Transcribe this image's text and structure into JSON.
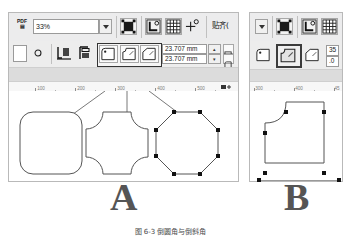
{
  "figure": {
    "caption": "图 6-3  倒圆角与倒斜角",
    "panel_a_label": "A",
    "panel_b_label": "B"
  },
  "panel_a": {
    "toolbar_top": {
      "app_icon": "pdf-icon",
      "zoom_value": "33%",
      "zoom_placeholder": "33%",
      "buttons": [
        {
          "name": "zoom-dropdown-toggle",
          "icon": "chevron-down-icon",
          "label": ""
        },
        {
          "name": "selection-tool-button",
          "icon": "selection-square-icon",
          "label": ""
        },
        {
          "name": "snap-bounding-box-button",
          "icon": "bbox-corner-icon",
          "label": ""
        },
        {
          "name": "snap-grid-button",
          "icon": "grid-icon",
          "label": ""
        },
        {
          "name": "snap-node-button",
          "icon": "node-snap-icon",
          "label": ""
        }
      ],
      "snap_label": "贴齐("
    },
    "toolbar_second": {
      "buttons": [
        {
          "name": "corner-radius-preview-button",
          "icon": "blank-box-icon",
          "label": ""
        },
        {
          "name": "ellipse-tool-button",
          "icon": "circle-icon",
          "label": ""
        },
        {
          "name": "mirror-horizontal-button",
          "icon": "mirror-h-icon",
          "label": ""
        },
        {
          "name": "mirror-vertical-button",
          "icon": "mirror-v-icon",
          "label": ""
        }
      ],
      "corner_types": [
        {
          "name": "corner-type-round-button",
          "icon": "round-corner-icon",
          "label": "",
          "selected": false
        },
        {
          "name": "corner-type-inverted-button",
          "icon": "inverted-corner-icon",
          "label": "",
          "selected": false
        },
        {
          "name": "corner-type-chamfer-button",
          "icon": "chamfer-corner-icon",
          "label": "",
          "selected": false
        }
      ],
      "radius_x": "23.707 mm",
      "radius_y": "23.707 mm",
      "stepper_up": "▴",
      "stepper_down": "▾",
      "lock_button_name": "lock-ratio-button",
      "corner_all_button_name": "apply-all-corners-button"
    },
    "ruler": {
      "labels": [
        "100",
        "200",
        "300",
        "400",
        "500"
      ],
      "unit_icon": "ruler-unit-icon"
    },
    "shapes": [
      {
        "name": "rounded-rectangle-shape",
        "type": "round"
      },
      {
        "name": "scalloped-square-shape",
        "type": "inverted"
      },
      {
        "name": "chamfered-octagon-shape",
        "type": "chamfer",
        "selected": true,
        "handle_count": 8
      }
    ]
  },
  "panel_b": {
    "toolbar_top": {
      "buttons": [
        {
          "name": "zoom-dropdown-toggle",
          "icon": "chevron-down-icon",
          "label": ""
        },
        {
          "name": "selection-tool-button",
          "icon": "selection-square-icon",
          "label": ""
        },
        {
          "name": "snap-bounding-box-button",
          "icon": "bbox-corner-icon",
          "label": ""
        },
        {
          "name": "snap-grid-button",
          "icon": "grid-icon",
          "label": ""
        }
      ]
    },
    "toolbar_second": {
      "corner_types": [
        {
          "name": "corner-type-round-button",
          "icon": "round-corner-icon",
          "label": "",
          "selected": false
        },
        {
          "name": "corner-type-inverted-button",
          "icon": "inverted-corner-icon",
          "label": "",
          "selected": true
        },
        {
          "name": "corner-type-chamfer-button",
          "icon": "chamfer-corner-icon",
          "label": "",
          "selected": false
        }
      ],
      "value_top": "35",
      "value_bottom": ".0"
    },
    "ruler": {
      "labels": [
        "300",
        "400",
        "45"
      ]
    },
    "shapes": [
      {
        "name": "single-inverted-corner-shape",
        "type": "inverted-one",
        "selected": true,
        "handle_count": 4
      }
    ]
  }
}
